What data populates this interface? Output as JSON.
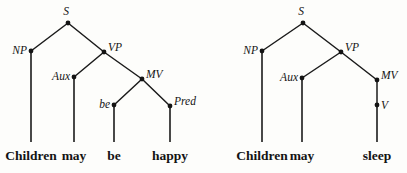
{
  "figure": {
    "background_color": "#fdfdfb",
    "ink_color": "#141414"
  },
  "trees": [
    {
      "id": "tree-left",
      "sentence": "Children may be happy",
      "nodes": [
        {
          "name": "S",
          "label": "S",
          "x": 68,
          "y": 23,
          "label_x": 66,
          "label_y": 15,
          "anchor": "middle"
        },
        {
          "name": "NP",
          "label": "NP",
          "x": 31,
          "y": 51,
          "label_x": 27,
          "label_y": 54,
          "anchor": "end"
        },
        {
          "name": "VP",
          "label": "VP",
          "x": 104,
          "y": 52,
          "label_x": 108,
          "label_y": 51,
          "anchor": "start"
        },
        {
          "name": "Aux",
          "label": "Aux",
          "x": 74,
          "y": 77,
          "label_x": 70,
          "label_y": 80,
          "anchor": "end"
        },
        {
          "name": "MV",
          "label": "MV",
          "x": 142,
          "y": 79,
          "label_x": 146,
          "label_y": 78,
          "anchor": "start"
        },
        {
          "name": "be",
          "label": "be",
          "x": 114,
          "y": 105,
          "label_x": 110,
          "label_y": 108,
          "anchor": "end"
        },
        {
          "name": "Pred",
          "label": "Pred",
          "x": 170,
          "y": 106,
          "label_x": 174,
          "label_y": 105,
          "anchor": "start"
        }
      ],
      "branches": [
        {
          "name": "s-to-np",
          "from": "S",
          "to": "NP"
        },
        {
          "name": "s-to-vp",
          "from": "S",
          "to": "VP"
        },
        {
          "name": "vp-to-aux",
          "from": "VP",
          "to": "Aux"
        },
        {
          "name": "vp-to-mv",
          "from": "VP",
          "to": "MV"
        },
        {
          "name": "mv-to-be",
          "from": "MV",
          "to": "be"
        },
        {
          "name": "mv-to-pred",
          "from": "MV",
          "to": "Pred"
        }
      ],
      "leaves": [
        {
          "name": "leaf-children",
          "word": "Children",
          "stem_x": 31,
          "stem_top": 51,
          "stem_bottom": 142,
          "text_x": 31,
          "text_y": 160
        },
        {
          "name": "leaf-may",
          "word": "may",
          "stem_x": 74,
          "stem_top": 77,
          "stem_bottom": 142,
          "text_x": 74,
          "text_y": 160
        },
        {
          "name": "leaf-be",
          "word": "be",
          "stem_x": 114,
          "stem_top": 105,
          "stem_bottom": 142,
          "text_x": 114,
          "text_y": 160
        },
        {
          "name": "leaf-happy",
          "word": "happy",
          "stem_x": 170,
          "stem_top": 106,
          "stem_bottom": 142,
          "text_x": 170,
          "text_y": 160
        }
      ]
    },
    {
      "id": "tree-right",
      "sentence": "Children may sleep",
      "nodes": [
        {
          "name": "S",
          "label": "S",
          "x": 303,
          "y": 23,
          "label_x": 301,
          "label_y": 15,
          "anchor": "middle"
        },
        {
          "name": "NP",
          "label": "NP",
          "x": 262,
          "y": 51,
          "label_x": 258,
          "label_y": 54,
          "anchor": "end"
        },
        {
          "name": "VP",
          "label": "VP",
          "x": 341,
          "y": 52,
          "label_x": 345,
          "label_y": 51,
          "anchor": "start"
        },
        {
          "name": "Aux",
          "label": "Aux",
          "x": 302,
          "y": 78,
          "label_x": 298,
          "label_y": 81,
          "anchor": "end"
        },
        {
          "name": "MV",
          "label": "MV",
          "x": 377,
          "y": 80,
          "label_x": 381,
          "label_y": 79,
          "anchor": "start"
        },
        {
          "name": "V",
          "label": "V",
          "x": 377,
          "y": 105,
          "label_x": 381,
          "label_y": 109,
          "anchor": "start"
        }
      ],
      "branches": [
        {
          "name": "s-to-np",
          "from": "S",
          "to": "NP"
        },
        {
          "name": "s-to-vp",
          "from": "S",
          "to": "VP"
        },
        {
          "name": "vp-to-aux",
          "from": "VP",
          "to": "Aux"
        },
        {
          "name": "vp-to-mv",
          "from": "VP",
          "to": "MV"
        },
        {
          "name": "mv-to-v",
          "from": "MV",
          "to": "V"
        }
      ],
      "leaves": [
        {
          "name": "leaf-children",
          "word": "Children",
          "stem_x": 262,
          "stem_top": 51,
          "stem_bottom": 142,
          "text_x": 262,
          "text_y": 160
        },
        {
          "name": "leaf-may",
          "word": "may",
          "stem_x": 302,
          "stem_top": 78,
          "stem_bottom": 142,
          "text_x": 302,
          "text_y": 160
        },
        {
          "name": "leaf-sleep",
          "word": "sleep",
          "stem_x": 377,
          "stem_top": 105,
          "stem_bottom": 142,
          "text_x": 377,
          "text_y": 160
        }
      ]
    }
  ]
}
